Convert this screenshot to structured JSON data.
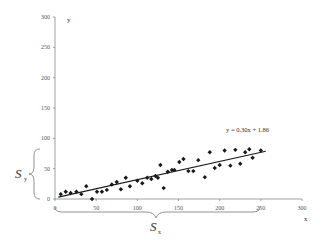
{
  "chart_data": {
    "type": "scatter",
    "title": "",
    "xlabel": "x",
    "ylabel": "y",
    "xlim": [
      0,
      300
    ],
    "ylim": [
      0,
      300
    ],
    "x_ticks": [
      0,
      50,
      100,
      150,
      200,
      250,
      300
    ],
    "y_ticks": [
      0,
      50,
      100,
      150,
      200,
      250,
      300
    ],
    "grid": false,
    "legend": null,
    "series": [
      {
        "name": "data",
        "marker": "diamond",
        "color": "#1a1a1a",
        "points": [
          [
            7,
            8
          ],
          [
            13,
            12
          ],
          [
            19,
            10
          ],
          [
            26,
            12
          ],
          [
            32,
            8
          ],
          [
            38,
            21
          ],
          [
            45,
            0
          ],
          [
            51,
            12
          ],
          [
            57,
            12
          ],
          [
            63,
            15
          ],
          [
            69,
            24
          ],
          [
            75,
            28
          ],
          [
            80,
            16
          ],
          [
            86,
            35
          ],
          [
            91,
            21
          ],
          [
            100,
            30
          ],
          [
            106,
            26
          ],
          [
            112,
            35
          ],
          [
            117,
            33
          ],
          [
            122,
            38
          ],
          [
            125,
            35
          ],
          [
            128,
            56
          ],
          [
            132,
            18
          ],
          [
            137,
            45
          ],
          [
            142,
            48
          ],
          [
            145,
            48
          ],
          [
            151,
            61
          ],
          [
            156,
            66
          ],
          [
            162,
            46
          ],
          [
            168,
            46
          ],
          [
            174,
            64
          ],
          [
            182,
            36
          ],
          [
            188,
            77
          ],
          [
            194,
            51
          ],
          [
            200,
            56
          ],
          [
            206,
            80
          ],
          [
            213,
            55
          ],
          [
            219,
            81
          ],
          [
            225,
            58
          ],
          [
            231,
            77
          ],
          [
            236,
            82
          ],
          [
            240,
            68
          ],
          [
            250,
            80
          ]
        ]
      },
      {
        "name": "trendline",
        "type": "line",
        "color": "#1a1a1a",
        "equation": "y = 0.30x + 1.86",
        "slope": 0.3,
        "intercept": 1.86,
        "x_range": [
          4,
          256
        ]
      }
    ],
    "annotations": [
      {
        "text": "y = 0.30x + 1.86",
        "x": 210,
        "y": 115
      },
      {
        "text": "S_y",
        "type": "brace",
        "axis": "y",
        "range": [
          0,
          80
        ]
      },
      {
        "text": "S_x",
        "type": "brace",
        "axis": "x",
        "range": [
          0,
          250
        ]
      }
    ]
  },
  "labels": {
    "x_axis": "x",
    "y_axis": "y",
    "equation": "y = 0.30x + 1.86",
    "sy_main": "S",
    "sy_sub": "y",
    "sx_main": "S",
    "sx_sub": "x"
  }
}
